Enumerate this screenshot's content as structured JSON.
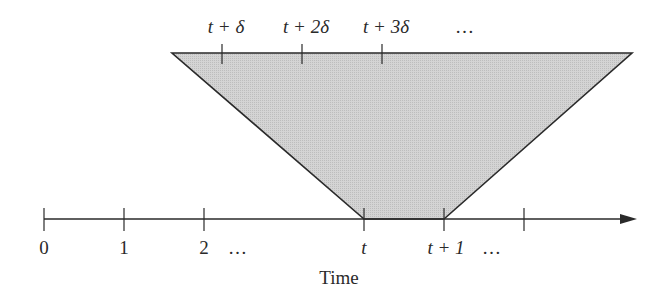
{
  "diagram": {
    "type": "timeline-window-diagram",
    "axis": {
      "label": "Time",
      "tick_labels": [
        "0",
        "1",
        "2",
        "t",
        "t + 1",
        ""
      ],
      "ellipses": [
        "…",
        "…"
      ],
      "color": "#2a2a2a"
    },
    "top_line": {
      "tick_labels": [
        "t + δ",
        "t + 2δ",
        "t + 3δ"
      ],
      "ellipsis": "…"
    },
    "region": {
      "fill": "#cfcfcf",
      "stroke": "#2a2a2a"
    }
  }
}
